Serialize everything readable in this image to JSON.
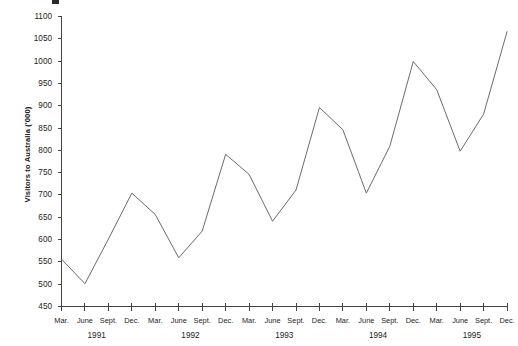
{
  "chart_data": {
    "type": "line",
    "title": "",
    "xlabel": "",
    "ylabel": "Visitors to Australia ('000)",
    "ylim": [
      450,
      1100
    ],
    "ytick_step": 50,
    "yticks": [
      450,
      500,
      550,
      600,
      650,
      700,
      750,
      800,
      850,
      900,
      950,
      1000,
      1050,
      1100
    ],
    "grid": false,
    "legend": "none",
    "categories": [
      "Mar.",
      "June",
      "Sept.",
      "Dec.",
      "Mar.",
      "June",
      "Sept.",
      "Dec.",
      "Mar.",
      "June",
      "Sept.",
      "Dec.",
      "Mar.",
      "June",
      "Sept.",
      "Dec.",
      "Mar.",
      "June",
      "Sept.",
      "Dec."
    ],
    "year_groups": [
      {
        "label": "1991",
        "start_index": 0,
        "end_index": 3
      },
      {
        "label": "1992",
        "start_index": 4,
        "end_index": 7
      },
      {
        "label": "1993",
        "start_index": 8,
        "end_index": 11
      },
      {
        "label": "1994",
        "start_index": 12,
        "end_index": 15
      },
      {
        "label": "1995",
        "start_index": 16,
        "end_index": 19
      }
    ],
    "series": [
      {
        "name": "Visitors to Australia",
        "color": "#6b6b6b",
        "values": [
          555,
          500,
          600,
          703,
          655,
          558,
          618,
          790,
          745,
          640,
          710,
          895,
          845,
          703,
          808,
          998,
          935,
          797,
          880,
          1065
        ]
      }
    ]
  },
  "axis": {
    "y_title": "Visitors to Australia ('000)"
  }
}
